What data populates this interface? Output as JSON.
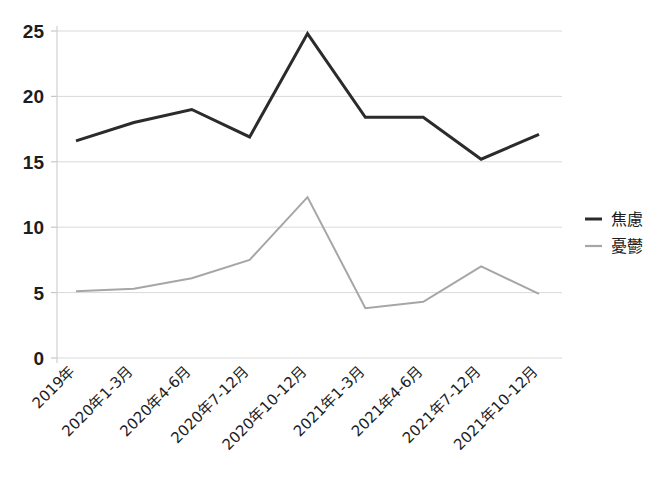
{
  "chart_data": {
    "type": "line",
    "title": "",
    "xlabel": "",
    "ylabel": "",
    "ylim": [
      0,
      25
    ],
    "ytick_step": 5,
    "grid": true,
    "legend_position": "right",
    "categories": [
      "2019年",
      "2020年1-3月",
      "2020年4-6月",
      "2020年7-12月",
      "2020年10-12月",
      "2021年1-3月",
      "2021年4-6月",
      "2021年7-12月",
      "2021年10-12月"
    ],
    "yticks": [
      "0",
      "5",
      "10",
      "15",
      "20",
      "25"
    ],
    "series": [
      {
        "name": "焦慮",
        "color": "#2b2b2b",
        "stroke_width": 3,
        "values": [
          16.6,
          18.0,
          19.0,
          16.9,
          24.8,
          18.4,
          18.4,
          15.2,
          17.1
        ]
      },
      {
        "name": "憂鬱",
        "color": "#a6a6a6",
        "stroke_width": 2,
        "values": [
          5.1,
          5.3,
          6.1,
          7.5,
          12.3,
          3.8,
          4.3,
          7.0,
          4.9
        ]
      }
    ]
  },
  "legend": {
    "items": [
      {
        "label": "焦慮",
        "color": "#2b2b2b"
      },
      {
        "label": "憂鬱",
        "color": "#a6a6a6"
      }
    ]
  },
  "axes": {
    "y_labels": [
      "25",
      "20",
      "15",
      "10",
      "5",
      "0"
    ],
    "x_labels": [
      "2019年",
      "2020年1-3月",
      "2020年4-6月",
      "2020年7-12月",
      "2020年10-12月",
      "2021年1-3月",
      "2021年4-6月",
      "2021年7-12月",
      "2021年10-12月"
    ]
  },
  "colors": {
    "anxiety": "#2b2b2b",
    "depression": "#a6a6a6",
    "grid": "#d9d9d9",
    "axis": "#d0d0d0",
    "background": "#ffffff"
  }
}
